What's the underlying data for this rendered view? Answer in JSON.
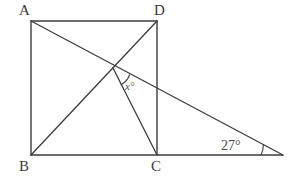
{
  "figure": {
    "type": "geometry-diagram",
    "canvas": {
      "width": 293,
      "height": 184
    },
    "stroke_color": "#3c3c3c",
    "text_color": "#3a3a3a",
    "background_color": "#ffffff",
    "stroke_width": 1.3
  },
  "points": {
    "A": {
      "label": "A",
      "x": 31,
      "y": 21
    },
    "D": {
      "label": "D",
      "x": 157,
      "y": 21
    },
    "B": {
      "label": "B",
      "x": 31,
      "y": 155
    },
    "C": {
      "label": "C",
      "x": 157,
      "y": 155
    },
    "E": {
      "label": "",
      "x": 283,
      "y": 155
    },
    "P": {
      "label": "",
      "x": 113,
      "y": 68
    }
  },
  "segments": [
    {
      "name": "side-AD",
      "from": "A",
      "to": "D"
    },
    {
      "name": "side-AB",
      "from": "A",
      "to": "B"
    },
    {
      "name": "side-DC",
      "from": "D",
      "to": "C"
    },
    {
      "name": "base-BE",
      "from": "B",
      "to": "E"
    },
    {
      "name": "diagonal-BD",
      "from": "B",
      "to": "D"
    },
    {
      "name": "line-AE",
      "from": "A",
      "to": "E"
    },
    {
      "name": "segment-PC",
      "from": "P",
      "to": "C"
    }
  ],
  "angles": {
    "x_angle": {
      "label": "x°",
      "vertex": "P",
      "arc_radius": 18
    },
    "known_angle": {
      "label": "27°",
      "value": 27,
      "unit": "degrees",
      "vertex": "E",
      "arc_radius": 22
    }
  },
  "labels": {
    "A": "A",
    "B": "B",
    "C": "C",
    "D": "D",
    "x": "x°",
    "twenty_seven": "27°"
  }
}
